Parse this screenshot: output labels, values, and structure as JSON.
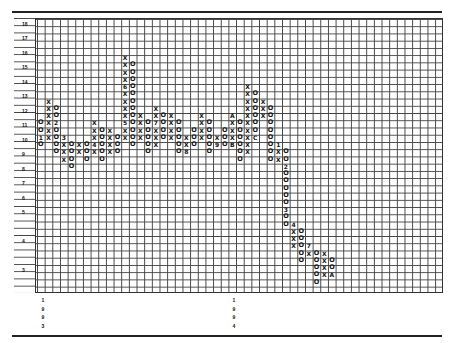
{
  "chart_data": {
    "type": "point-and-figure",
    "title": "",
    "xlabel": "",
    "ylabel": "",
    "y_tick_labels": [
      "18",
      "17",
      "16",
      "15",
      "14",
      "13",
      "12",
      "11",
      "10",
      "9",
      "8",
      "7",
      "6",
      "5",
      "4",
      "3"
    ],
    "x_labels": [
      {
        "label": "1993",
        "col": 1
      },
      {
        "label": "1994",
        "col": 26
      }
    ],
    "grid": true,
    "box_rows_note": "row index 0 = 18, half-unit boxes above 5",
    "columns": [
      {
        "col": 0,
        "type": "O",
        "cells": {
          "14": "O",
          "15": "O",
          "16": "1",
          "17": "O"
        }
      },
      {
        "col": 1,
        "type": "X",
        "cells": {
          "11": "X",
          "12": "X",
          "13": "X",
          "14": "X",
          "15": "X",
          "16": "X"
        }
      },
      {
        "col": 2,
        "type": "O",
        "cells": {
          "12": "O",
          "13": "O",
          "14": "2",
          "15": "O",
          "16": "O",
          "17": "O",
          "18": "O"
        }
      },
      {
        "col": 3,
        "type": "X",
        "cells": {
          "16": "3",
          "17": "X",
          "18": "X",
          "19": "X"
        }
      },
      {
        "col": 4,
        "type": "O",
        "cells": {
          "17": "O",
          "18": "O",
          "19": "O",
          "20": "O"
        }
      },
      {
        "col": 5,
        "type": "X",
        "cells": {
          "17": "X",
          "18": "X"
        }
      },
      {
        "col": 6,
        "type": "O",
        "cells": {
          "17": "O",
          "18": "O",
          "19": "O"
        }
      },
      {
        "col": 7,
        "type": "X",
        "cells": {
          "14": "X",
          "15": "X",
          "16": "X",
          "17": "4",
          "18": "X"
        }
      },
      {
        "col": 8,
        "type": "O",
        "cells": {
          "15": "O",
          "16": "O",
          "17": "O",
          "18": "O",
          "19": "O"
        }
      },
      {
        "col": 9,
        "type": "X",
        "cells": {
          "15": "X",
          "16": "X",
          "17": "X",
          "18": "X"
        }
      },
      {
        "col": 10,
        "type": "O",
        "cells": {
          "16": "O",
          "17": "O",
          "18": "O"
        }
      },
      {
        "col": 11,
        "type": "X",
        "cells": {
          "5": "X",
          "6": "X",
          "7": "X",
          "8": "X",
          "9": "6",
          "10": "X",
          "11": "X",
          "12": "X",
          "13": "X",
          "14": "5",
          "15": "X",
          "16": "X"
        }
      },
      {
        "col": 12,
        "type": "O",
        "cells": {
          "6": "O",
          "7": "O",
          "8": "O",
          "9": "O",
          "10": "O",
          "11": "O",
          "12": "O",
          "13": "O",
          "14": "O",
          "15": "O",
          "16": "O",
          "17": "O"
        }
      },
      {
        "col": 13,
        "type": "X",
        "cells": {
          "13": "X",
          "14": "X",
          "15": "X",
          "16": "X"
        }
      },
      {
        "col": 14,
        "type": "O",
        "cells": {
          "14": "O",
          "15": "O",
          "16": "O",
          "17": "O",
          "18": "O"
        }
      },
      {
        "col": 15,
        "type": "X",
        "cells": {
          "12": "X",
          "13": "X",
          "14": "7",
          "15": "X",
          "16": "X",
          "17": "X"
        }
      },
      {
        "col": 16,
        "type": "O",
        "cells": {
          "13": "O",
          "14": "O",
          "15": "O",
          "16": "O"
        }
      },
      {
        "col": 17,
        "type": "X",
        "cells": {
          "13": "X",
          "14": "X",
          "15": "X",
          "16": "X"
        }
      },
      {
        "col": 18,
        "type": "O",
        "cells": {
          "14": "O",
          "15": "O",
          "16": "O",
          "17": "O",
          "18": "O"
        }
      },
      {
        "col": 19,
        "type": "X",
        "cells": {
          "16": "X",
          "17": "X",
          "18": "8"
        }
      },
      {
        "col": 20,
        "type": "O",
        "cells": {
          "15": "O",
          "16": "O",
          "17": "O"
        }
      },
      {
        "col": 21,
        "type": "X",
        "cells": {
          "13": "X",
          "14": "X",
          "15": "X",
          "16": "X"
        }
      },
      {
        "col": 22,
        "type": "O",
        "cells": {
          "14": "O",
          "15": "O",
          "16": "O",
          "17": "O",
          "18": "O"
        }
      },
      {
        "col": 23,
        "type": "X",
        "cells": {
          "16": "X",
          "17": "9"
        }
      },
      {
        "col": 24,
        "type": "O",
        "cells": {
          "15": "O",
          "16": "O",
          "17": "O"
        }
      },
      {
        "col": 25,
        "type": "X",
        "cells": {
          "13": "A",
          "14": "X",
          "15": "X",
          "16": "X",
          "17": "B"
        }
      },
      {
        "col": 26,
        "type": "O",
        "cells": {
          "14": "O",
          "15": "O",
          "16": "O",
          "17": "O",
          "18": "O",
          "19": "O"
        }
      },
      {
        "col": 27,
        "type": "X",
        "cells": {
          "9": "X",
          "10": "X",
          "11": "X",
          "12": "X",
          "13": "X",
          "14": "X",
          "15": "X",
          "16": "X",
          "17": "X",
          "18": "X"
        }
      },
      {
        "col": 28,
        "type": "O",
        "cells": {
          "10": "O",
          "11": "O",
          "12": "O",
          "13": "O",
          "14": "O",
          "15": "O",
          "16": "C"
        }
      },
      {
        "col": 29,
        "type": "X",
        "cells": {
          "11": "X",
          "12": "X",
          "13": "X"
        }
      },
      {
        "col": 30,
        "type": "O",
        "cells": {
          "12": "O",
          "13": "O",
          "14": "O",
          "15": "O",
          "16": "O",
          "17": "O",
          "18": "O",
          "19": "O"
        }
      },
      {
        "col": 31,
        "type": "X",
        "cells": {
          "17": "1",
          "18": "X",
          "19": "X"
        }
      },
      {
        "col": 32,
        "type": "O",
        "cells": {
          "18": "O",
          "19": "O",
          "20": "2",
          "21": "O",
          "22": "O",
          "23": "O",
          "24": "O",
          "25": "O",
          "26": "3",
          "27": "O",
          "28": "O"
        }
      },
      {
        "col": 33,
        "type": "X",
        "cells": {
          "28": "4",
          "29": "X",
          "30": "X",
          "31": "X"
        }
      },
      {
        "col": 34,
        "type": "O",
        "cells": {
          "29": "O",
          "30": "O",
          "31": "O",
          "32": "O",
          "33": "O"
        }
      },
      {
        "col": 35,
        "type": "X",
        "cells": {
          "31": "7",
          "32": "X"
        }
      },
      {
        "col": 36,
        "type": "O",
        "cells": {
          "32": "O",
          "33": "O",
          "34": "O",
          "35": "O",
          "36": "O"
        }
      },
      {
        "col": 37,
        "type": "X",
        "cells": {
          "32": "X",
          "33": "X",
          "34": "X",
          "35": "X"
        }
      },
      {
        "col": 38,
        "type": "O",
        "cells": {
          "33": "O",
          "34": "O",
          "35": "A"
        }
      }
    ],
    "annotations": [
      "1",
      "2",
      "3",
      "4",
      "5",
      "6",
      "7",
      "8",
      "9",
      "A",
      "B",
      "C"
    ]
  },
  "axis": {
    "y_labels": [
      {
        "text": "18",
        "top": 21
      },
      {
        "text": "17",
        "top": 35
      },
      {
        "text": "16",
        "top": 50
      },
      {
        "text": "15",
        "top": 64
      },
      {
        "text": "14",
        "top": 79
      },
      {
        "text": "13",
        "top": 93
      },
      {
        "text": "12",
        "top": 108
      },
      {
        "text": "11",
        "top": 122
      },
      {
        "text": "10",
        "top": 137
      },
      {
        "text": "9",
        "top": 151
      },
      {
        "text": "8",
        "top": 166
      },
      {
        "text": "7",
        "top": 180
      },
      {
        "text": "6",
        "top": 195
      },
      {
        "text": "5",
        "top": 209
      },
      {
        "text": "4",
        "top": 238
      },
      {
        "text": "3",
        "top": 267
      }
    ]
  },
  "years": {
    "first": [
      "1",
      "9",
      "9",
      "3"
    ],
    "second": [
      "1",
      "9",
      "9",
      "4"
    ]
  }
}
